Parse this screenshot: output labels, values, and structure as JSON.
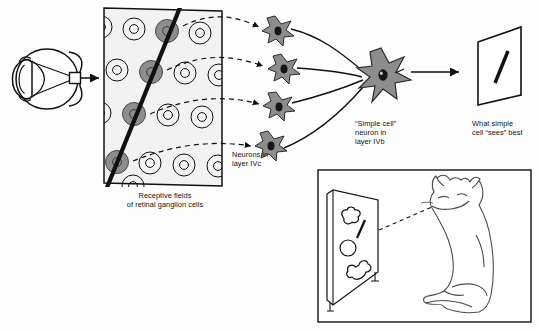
{
  "figure": {
    "background_color": "#fdfdfd",
    "ink_color": "#111111",
    "neuron_fill": "#8d8d8d",
    "neuron_nucleus": "#1a1a1a",
    "receptive_field_panel_fill": "#f2f2f2",
    "excited_field_fill": "#8d8d8d"
  },
  "labels": {
    "receptive_fields": "Receptive fields\nof retinal ganglion cells",
    "neurons_ivc": "Neurons in\nlayer IVc",
    "simple_cell": "“Simple cell”\nneuron in\nlayer IVb",
    "sees_best": "What simple\ncell “sees” best"
  },
  "eye": {
    "name": "cat-eye-cross-section",
    "parts": [
      "cornea",
      "lens",
      "retina",
      "optic-nerve",
      "fovea-window"
    ]
  },
  "receptive_field_grid": {
    "rows": 5,
    "columns": 4,
    "field_type": "center-surround-concentric",
    "activated_fields": 5,
    "stimulus_bar": {
      "type": "oriented-line",
      "orientation_degrees": 72,
      "description": "slanted dark bar crossing the activated receptive fields"
    }
  },
  "ivc_neurons": {
    "count": 4,
    "shape": "stellate",
    "layer": "IVc"
  },
  "simple_cell": {
    "count": 1,
    "shape": "stellate",
    "layer": "IVb",
    "inputs": 4
  },
  "connections": {
    "dashed_arrows": 4,
    "dashed_description": "receptive fields to layer IVc neurons",
    "solid_curves": 4,
    "solid_description": "layer IVc neurons converging on simple cell"
  },
  "output_screen": {
    "shape": "tilted-quadrilateral-screen",
    "stimulus": "diagonal-bar"
  },
  "cat_panel": {
    "border": true,
    "screen_shapes": [
      "cloud-blob",
      "diagonal-bar",
      "circle",
      "bone"
    ],
    "animal": "sitting-cat",
    "gaze_line": "dashed"
  }
}
